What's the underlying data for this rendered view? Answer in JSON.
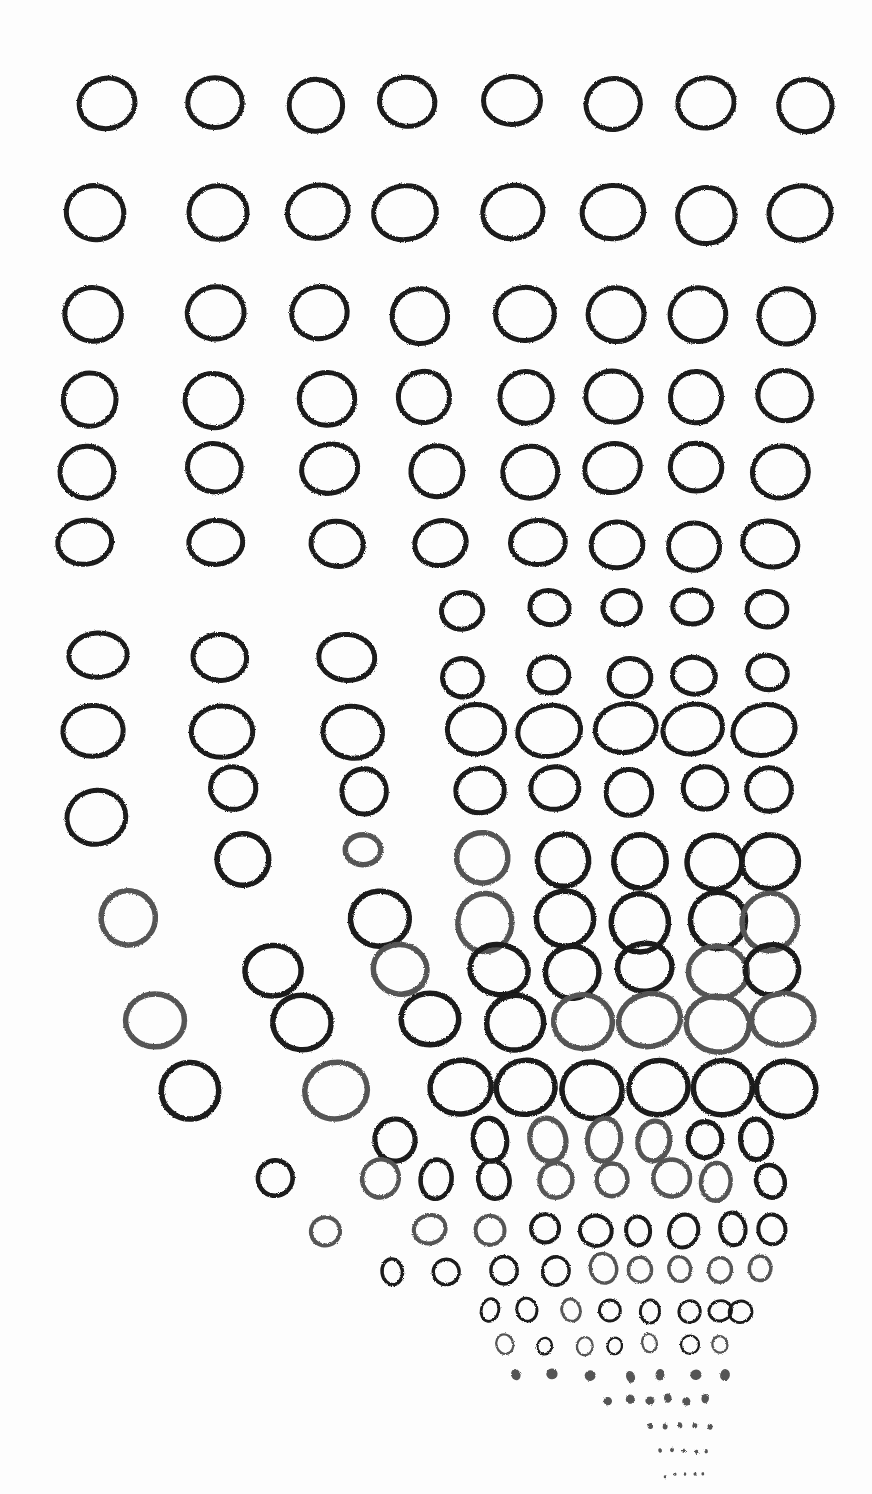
{
  "artwork": {
    "subject": "hand-drawn crayon circles converging toward bottom right",
    "stroke_color": "#1a1a1a",
    "stroke_color_light": "#555555",
    "background": "#fdfdfd",
    "rows": [
      {
        "y": 103,
        "rx": 28,
        "ry": 25,
        "xs": [
          107,
          215,
          316,
          407,
          512,
          613,
          706,
          806
        ]
      },
      {
        "y": 213,
        "rx": 30,
        "ry": 27,
        "xs": [
          95,
          218,
          318,
          405,
          513,
          613,
          706,
          800
        ]
      },
      {
        "y": 315,
        "rx": 28,
        "ry": 27,
        "xs": [
          93,
          216,
          320,
          420,
          525,
          616,
          698,
          786
        ]
      },
      {
        "y": 398,
        "rx": 27,
        "ry": 26,
        "xs": [
          90,
          214,
          327,
          424,
          526,
          613,
          696,
          784
        ]
      },
      {
        "y": 470,
        "rx": 27,
        "ry": 25,
        "xs": [
          87,
          214,
          330,
          437,
          530,
          613,
          696,
          780
        ]
      },
      {
        "y": 545,
        "rx": 27,
        "ry": 23,
        "xs": [
          85,
          216,
          337,
          441,
          538,
          617,
          694,
          770
        ]
      },
      {
        "y": 610,
        "rx": 20,
        "ry": 18,
        "xs": [
          462,
          549,
          622,
          692,
          767
        ]
      },
      {
        "y": 655,
        "rx": 28,
        "ry": 22,
        "xs": [
          98,
          220,
          347
        ]
      },
      {
        "y": 675,
        "rx": 20,
        "ry": 18,
        "xs": [
          463,
          549,
          630,
          694,
          767
        ]
      },
      {
        "y": 730,
        "rx": 30,
        "ry": 25,
        "xs": [
          93,
          222,
          353,
          476,
          549,
          626,
          693,
          764
        ]
      },
      {
        "y": 790,
        "rx": 23,
        "ry": 22,
        "xs": [
          233,
          364,
          480,
          555,
          629,
          705,
          769
        ]
      },
      {
        "y": 820,
        "rx": 30,
        "ry": 28,
        "xs": [
          97
        ]
      },
      {
        "y": 850,
        "rx": 17,
        "ry": 15,
        "xs": [
          363
        ]
      },
      {
        "y": 860,
        "rx": 27,
        "ry": 26,
        "xs": [
          243,
          482,
          563,
          640,
          715,
          770
        ]
      },
      {
        "y": 920,
        "rx": 28,
        "ry": 28,
        "xs": [
          128,
          380,
          485,
          565,
          640,
          718,
          770
        ]
      },
      {
        "y": 970,
        "rx": 28,
        "ry": 25,
        "xs": [
          273,
          400,
          499,
          572,
          645,
          718,
          772
        ]
      },
      {
        "y": 1022,
        "rx": 30,
        "ry": 27,
        "xs": [
          155,
          302,
          430,
          515,
          583,
          650,
          718,
          783
        ]
      },
      {
        "y": 1090,
        "rx": 30,
        "ry": 28,
        "xs": [
          190,
          336,
          461,
          526,
          592,
          659,
          723,
          786
        ]
      }
    ],
    "fan": [
      {
        "y": 1140,
        "r": 18,
        "xs": [
          395,
          490,
          548,
          604,
          654,
          705,
          756
        ]
      },
      {
        "y": 1180,
        "r": 16,
        "xs": [
          275,
          380,
          436,
          494,
          556,
          612,
          672,
          716,
          770
        ]
      },
      {
        "y": 1230,
        "r": 14,
        "xs": [
          325,
          430,
          490,
          545,
          596,
          638,
          684,
          733,
          772
        ]
      },
      {
        "y": 1270,
        "r": 12,
        "xs": [
          392,
          446,
          504,
          556,
          604,
          640,
          680,
          720,
          760
        ]
      },
      {
        "y": 1310,
        "r": 10,
        "xs": [
          490,
          527,
          571,
          610,
          650,
          690,
          720,
          740
        ]
      },
      {
        "y": 1345,
        "r": 8,
        "xs": [
          505,
          545,
          585,
          615,
          650,
          690,
          720
        ]
      },
      {
        "y": 1375,
        "r": 5,
        "xs": [
          516,
          552,
          590,
          630,
          660,
          696,
          725
        ]
      },
      {
        "y": 1400,
        "r": 4,
        "xs": [
          608,
          630,
          650,
          668,
          686,
          705
        ]
      },
      {
        "y": 1425,
        "r": 2.5,
        "xs": [
          650,
          665,
          680,
          695,
          710
        ]
      },
      {
        "y": 1450,
        "r": 2,
        "xs": [
          660,
          672,
          684,
          696,
          706
        ]
      },
      {
        "y": 1475,
        "r": 1.5,
        "xs": [
          665,
          675,
          685,
          695,
          703
        ]
      }
    ]
  }
}
